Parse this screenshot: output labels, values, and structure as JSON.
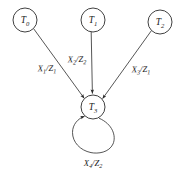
{
  "diagram": {
    "type": "state-transition-diagram",
    "background_color": "#ffffff",
    "stroke_color": "#2b2b2b",
    "text_color": "#1a1a1a",
    "nodes": [
      {
        "id": "T0",
        "base": "T",
        "sub": "0",
        "cx": 25,
        "cy": 20,
        "r": 12
      },
      {
        "id": "T1",
        "base": "T",
        "sub": "1",
        "cx": 93,
        "cy": 20,
        "r": 12
      },
      {
        "id": "T2",
        "base": "T",
        "sub": "2",
        "cx": 160,
        "cy": 22,
        "r": 12
      },
      {
        "id": "T3",
        "base": "T",
        "sub": "3",
        "cx": 93,
        "cy": 107,
        "r": 12
      }
    ],
    "edges": [
      {
        "id": "e1",
        "from": "T0",
        "to": "T3",
        "input": "X",
        "input_sub": "1",
        "output": "Z",
        "output_sub": "1",
        "label_x": 47,
        "label_y": 68
      },
      {
        "id": "e2",
        "from": "T1",
        "to": "T3",
        "input": "X",
        "input_sub": "2",
        "output": "Z",
        "output_sub": "2",
        "label_x": 77,
        "label_y": 59
      },
      {
        "id": "e3",
        "from": "T2",
        "to": "T3",
        "input": "X",
        "input_sub": "3",
        "output": "Z",
        "output_sub": "1",
        "label_x": 141,
        "label_y": 69
      },
      {
        "id": "e4",
        "from": "T3",
        "to": "T3",
        "input": "X",
        "input_sub": "4",
        "output": "Z",
        "output_sub": "2",
        "label_x": 93,
        "label_y": 163,
        "self_loop": true
      }
    ],
    "separator": "/"
  }
}
